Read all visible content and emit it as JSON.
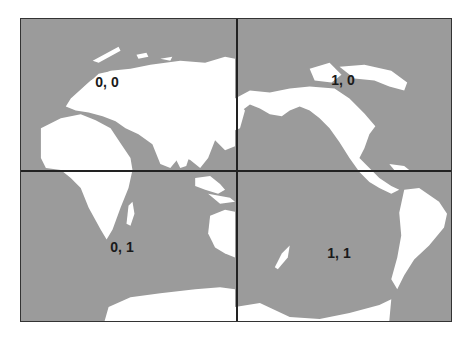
{
  "map": {
    "projection": "world map centered on Pacific",
    "colors": {
      "ocean": "#9b9b9b",
      "land": "#ffffff",
      "grid": "#222222"
    },
    "grid": {
      "columns": 2,
      "rows": 2
    },
    "tiles": [
      {
        "id": "tile-0-0",
        "label": "0, 0",
        "col": 0,
        "row": 0
      },
      {
        "id": "tile-1-0",
        "label": "1, 0",
        "col": 1,
        "row": 0
      },
      {
        "id": "tile-0-1",
        "label": "0, 1",
        "col": 0,
        "row": 1
      },
      {
        "id": "tile-1-1",
        "label": "1, 1",
        "col": 1,
        "row": 1
      }
    ]
  }
}
